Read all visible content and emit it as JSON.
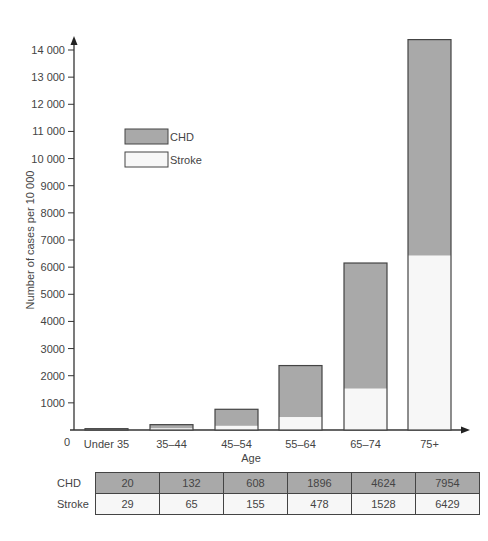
{
  "chart_data": {
    "type": "bar",
    "stacked": true,
    "title": "",
    "xlabel": "Age",
    "ylabel": "Number of cases per 10 000",
    "categories": [
      "Under 35",
      "35–44",
      "45–54",
      "55–64",
      "65–74",
      "75+"
    ],
    "series": [
      {
        "name": "Stroke",
        "color": "#f7f7f7",
        "values": [
          29,
          65,
          155,
          478,
          1528,
          6429
        ]
      },
      {
        "name": "CHD",
        "color": "#a9a9a9",
        "values": [
          20,
          132,
          608,
          1896,
          4624,
          7954
        ]
      }
    ],
    "ylim": [
      0,
      14000
    ],
    "yticks": [
      1000,
      2000,
      3000,
      4000,
      5000,
      6000,
      7000,
      8000,
      9000,
      10000,
      11000,
      12000,
      13000,
      14000
    ],
    "ytick_labels": [
      "1000",
      "2000",
      "3000",
      "4000",
      "5000",
      "6000",
      "7000",
      "8000",
      "9000",
      "10 000",
      "11 000",
      "12 000",
      "13 000",
      "14 000"
    ],
    "origin_label": "0",
    "grid": false,
    "legend": {
      "position": "upper-left-inside",
      "entries": [
        "CHD",
        "Stroke"
      ]
    }
  },
  "legend": {
    "chd_label": "CHD",
    "stroke_label": "Stroke"
  },
  "table": {
    "rows": [
      {
        "label": "CHD",
        "values": [
          "20",
          "132",
          "608",
          "1896",
          "4624",
          "7954"
        ]
      },
      {
        "label": "Stroke",
        "values": [
          "29",
          "65",
          "155",
          "478",
          "1528",
          "6429"
        ]
      }
    ]
  }
}
